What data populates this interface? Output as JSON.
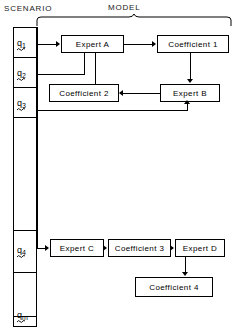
{
  "headers": {
    "scenario": "SCENARIO",
    "model": "MODEL"
  },
  "scenario": {
    "cells": [
      {
        "label": "q",
        "sub": "1",
        "name": "scenario-cell-q1"
      },
      {
        "label": "q",
        "sub": "2",
        "name": "scenario-cell-q2"
      },
      {
        "label": "q",
        "sub": "3",
        "name": "scenario-cell-q3"
      },
      {
        "label": "",
        "sub": "",
        "name": "scenario-cell-blank-1"
      },
      {
        "label": "q",
        "sub": "4",
        "name": "scenario-cell-q4"
      },
      {
        "label": "",
        "sub": "",
        "name": "scenario-cell-blank-2"
      },
      {
        "label": "q",
        "sub": "m",
        "name": "scenario-cell-qm"
      }
    ]
  },
  "model": {
    "nodes": [
      {
        "id": "expert-a",
        "label": "Expert A"
      },
      {
        "id": "coefficient-1",
        "label": "Coefficient 1"
      },
      {
        "id": "coefficient-2",
        "label": "Coefficient 2"
      },
      {
        "id": "expert-b",
        "label": "Expert B"
      },
      {
        "id": "expert-c",
        "label": "Expert C"
      },
      {
        "id": "coefficient-3",
        "label": "Coefficient 3"
      },
      {
        "id": "expert-d",
        "label": "Expert D"
      },
      {
        "id": "coefficient-4",
        "label": "Coefficient 4"
      }
    ]
  },
  "colors": {
    "ink": "#000000",
    "paper": "#ffffff"
  }
}
